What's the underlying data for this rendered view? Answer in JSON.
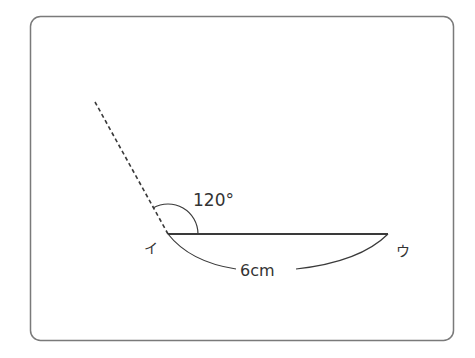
{
  "figure": {
    "frame": {
      "x": 30,
      "y": 16,
      "width": 423,
      "height": 324,
      "radius": 10,
      "stroke": "#7a7a7a"
    },
    "vertex_label": "イ",
    "end_label": "ウ",
    "angle_label": "120°",
    "length_label": "6cm",
    "line_color": "#3a3a3a",
    "vertex": {
      "x": 168,
      "y": 234
    },
    "segment_end": {
      "x": 388,
      "y": 234
    },
    "ray_end": {
      "x": 95,
      "y": 102
    },
    "angle_degrees": 120,
    "segment_length_cm": 6
  }
}
